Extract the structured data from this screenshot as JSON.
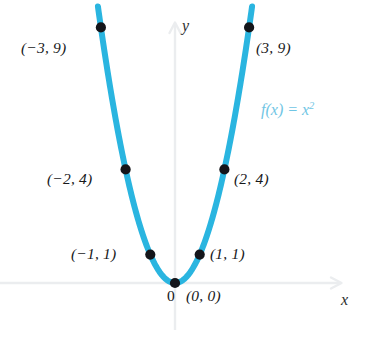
{
  "chart_data": {
    "type": "line",
    "title": "",
    "subtitle": "",
    "function_label": "f(x) = x",
    "function_exponent": "2",
    "equation": "f(x) = x^2",
    "xlabel": "x",
    "ylabel": "y",
    "xlim": [
      -3.6,
      6.4
    ],
    "ylim": [
      -1.8,
      9.9
    ],
    "grid": false,
    "legend_position": "inside-right",
    "axes_style": "arrow-headed, light gray",
    "curve_color": "#2ab5e0",
    "point_color": "#14151a",
    "axis_color": "#ebedef",
    "label_color": "#17181a",
    "equation_color": "#6fc5e4",
    "series": [
      {
        "name": "f(x) = x^2",
        "x": [
          -3,
          -2,
          -1,
          0,
          1,
          2,
          3
        ],
        "values": [
          9,
          4,
          1,
          0,
          1,
          4,
          9
        ]
      }
    ],
    "points": [
      {
        "id": "m3",
        "x": -3,
        "y": 9,
        "label": "(−3, 9)",
        "label_side": "left"
      },
      {
        "id": "m2",
        "x": -2,
        "y": 4,
        "label": "(−2, 4)",
        "label_side": "left"
      },
      {
        "id": "m1",
        "x": -1,
        "y": 1,
        "label": "(−1, 1)",
        "label_side": "left"
      },
      {
        "id": "p0",
        "x": 0,
        "y": 0,
        "label": "(0, 0)",
        "label_side": "right"
      },
      {
        "id": "p1",
        "x": 1,
        "y": 1,
        "label": "(1, 1)",
        "label_side": "right"
      },
      {
        "id": "p2",
        "x": 2,
        "y": 4,
        "label": "(2, 4)",
        "label_side": "right"
      },
      {
        "id": "p3",
        "x": 3,
        "y": 9,
        "label": "(3, 9)",
        "label_side": "right"
      }
    ],
    "annotations": [
      {
        "id": "origin-tick",
        "text": "0",
        "x": 0,
        "y": 0,
        "position": "below-left-of-origin"
      }
    ]
  }
}
